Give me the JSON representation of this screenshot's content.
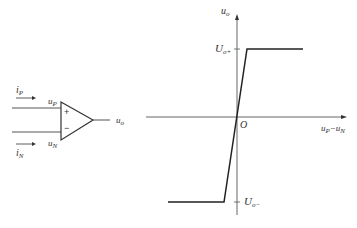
{
  "opamp": {
    "input_current_p": "i",
    "input_current_p_sub": "P",
    "input_current_n": "i",
    "input_current_n_sub": "N",
    "input_p": "u",
    "input_p_sub": "P",
    "input_n": "u",
    "input_n_sub": "N",
    "plus_sign": "+",
    "minus_sign": "−",
    "output": "u",
    "output_sub": "o"
  },
  "transfer_curve": {
    "y_axis": "u",
    "y_axis_sub": "o",
    "x_axis_a": "u",
    "x_axis_a_sub": "P",
    "x_axis_minus": "−",
    "x_axis_b": "u",
    "x_axis_b_sub": "N",
    "origin": "O",
    "upper_sat": "U",
    "upper_sat_sub": "o+",
    "lower_sat": "U",
    "lower_sat_sub": "o−"
  },
  "colors": {
    "line": "#333333",
    "axis": "#555555"
  }
}
